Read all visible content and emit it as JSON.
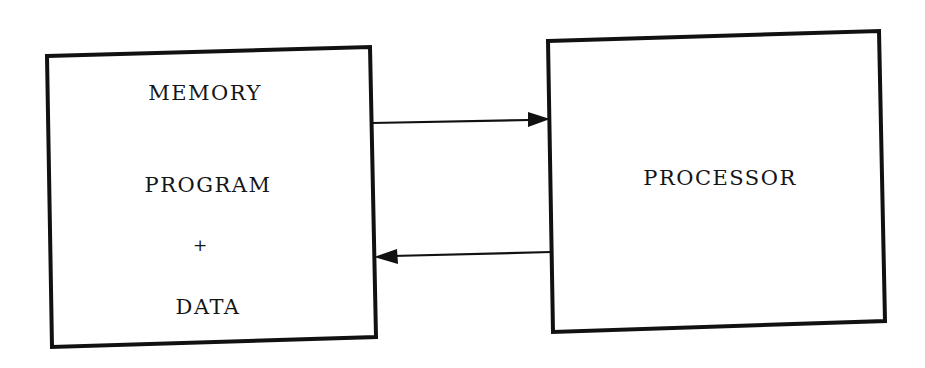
{
  "diagram": {
    "memory_box": {
      "title": "MEMORY",
      "line1": "PROGRAM",
      "plus": "+",
      "line2": "DATA"
    },
    "processor_box": {
      "title": "PROCESSOR"
    },
    "arrows": [
      {
        "from": "MEMORY",
        "to": "PROCESSOR",
        "direction": "right"
      },
      {
        "from": "PROCESSOR",
        "to": "MEMORY",
        "direction": "left"
      }
    ],
    "stroke_color": "#111111"
  }
}
